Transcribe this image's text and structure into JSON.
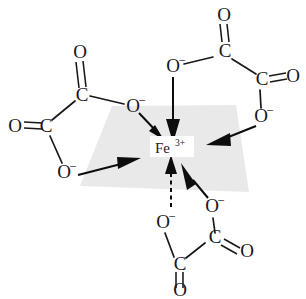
{
  "figure": {
    "name": "tris-oxalato-iron-iii-complex",
    "center": {
      "element": "Fe",
      "charge": "3+",
      "label": "Fe3+"
    },
    "plane": {
      "color": "#e9e9e9",
      "description": "equatorial coordination plane"
    },
    "atoms": {
      "oxygen": "O",
      "carbon": "C",
      "oxygen_anion_charge": "–"
    },
    "ligands": [
      {
        "name": "oxalate-left",
        "position": "left",
        "atoms": [
          {
            "label": "O",
            "charge": "–",
            "role": "coordinating-upper"
          },
          {
            "label": "C",
            "charge": "",
            "role": "carboxyl-upper"
          },
          {
            "label": "O",
            "charge": "",
            "role": "carbonyl-upper"
          },
          {
            "label": "C",
            "charge": "",
            "role": "carboxyl-lower"
          },
          {
            "label": "O",
            "charge": "",
            "role": "carbonyl-lower"
          },
          {
            "label": "O",
            "charge": "–",
            "role": "coordinating-lower"
          }
        ]
      },
      {
        "name": "oxalate-top-right",
        "position": "top-right",
        "atoms": [
          {
            "label": "O",
            "charge": "–",
            "role": "coordinating-left"
          },
          {
            "label": "C",
            "charge": "",
            "role": "carboxyl-upper"
          },
          {
            "label": "O",
            "charge": "",
            "role": "carbonyl-upper"
          },
          {
            "label": "C",
            "charge": "",
            "role": "carboxyl-right"
          },
          {
            "label": "O",
            "charge": "",
            "role": "carbonyl-right"
          },
          {
            "label": "O",
            "charge": "–",
            "role": "coordinating-right"
          }
        ]
      },
      {
        "name": "oxalate-bottom",
        "position": "bottom",
        "atoms": [
          {
            "label": "O",
            "charge": "–",
            "role": "coordinating-left"
          },
          {
            "label": "C",
            "charge": "",
            "role": "carboxyl-lower"
          },
          {
            "label": "O",
            "charge": "",
            "role": "carbonyl-lower"
          },
          {
            "label": "C",
            "charge": "",
            "role": "carboxyl-right"
          },
          {
            "label": "O",
            "charge": "",
            "role": "carbonyl-right"
          },
          {
            "label": "O",
            "charge": "–",
            "role": "coordinating-right"
          }
        ]
      }
    ],
    "bond_arrows": [
      {
        "name": "arrow-from-left-upper-o",
        "style": "solid"
      },
      {
        "name": "arrow-from-left-lower-o",
        "style": "solid"
      },
      {
        "name": "arrow-from-top-o",
        "style": "solid"
      },
      {
        "name": "arrow-from-right-o",
        "style": "solid"
      },
      {
        "name": "arrow-from-bottom-left-o",
        "style": "dashed"
      },
      {
        "name": "arrow-from-bottom-right-o",
        "style": "solid"
      }
    ]
  },
  "labels": {
    "metal_element": "Fe",
    "metal_charge": "3+",
    "o1_sym": "O",
    "o1_chg": "–",
    "o2_sym": "O",
    "o2_chg": "–",
    "o3_sym": "O",
    "o3_chg": "–",
    "o4_sym": "O",
    "o4_chg": "–",
    "o5_sym": "O",
    "o5_chg": "–",
    "o6_sym": "O",
    "o6_chg": "–",
    "ox_l_up": "O",
    "ox_l_lo": "O",
    "ox_tr_up": "O",
    "ox_tr_rt": "O",
    "ox_b_rt": "O",
    "ox_b_lo": "O",
    "c_l_up": "C",
    "c_l_lo": "C",
    "c_tr_up": "C",
    "c_tr_rt": "C",
    "c_b_rt": "C",
    "c_b_lo": "C"
  }
}
